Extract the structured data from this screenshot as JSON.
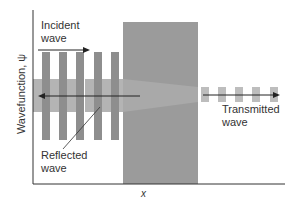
{
  "figure": {
    "y_axis_label": "Wavefunction, ψ",
    "x_axis_label": "x",
    "annotations": {
      "incident": [
        "Incident",
        "wave"
      ],
      "reflected": [
        "Reflected",
        "wave"
      ],
      "transmitted": [
        "Transmitted",
        "wave"
      ]
    },
    "colors": {
      "barrier": "#9b9b9b",
      "incident_bars": "#8e8e8e",
      "reflected_bars": "#b4b4b4",
      "transmitted_bars": "#bdbdbd",
      "axis": "#333333",
      "arrow": "#222222"
    }
  }
}
